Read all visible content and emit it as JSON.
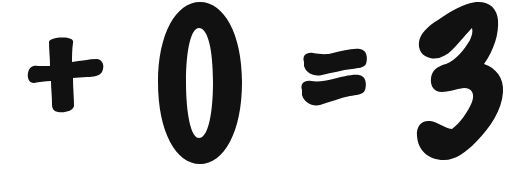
{
  "equation": {
    "text": "+ 0 = 3",
    "symbols": [
      {
        "name": "plus",
        "char": "+"
      },
      {
        "name": "zero",
        "char": "0"
      },
      {
        "name": "equals",
        "char": "="
      },
      {
        "name": "three",
        "char": "3"
      }
    ]
  },
  "colors": {
    "ink": "#111111",
    "background": "#ffffff"
  }
}
